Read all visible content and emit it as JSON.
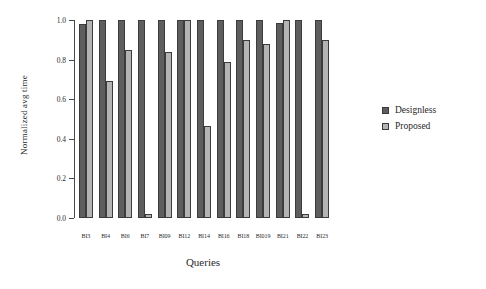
{
  "chart_data": {
    "type": "bar",
    "title": "",
    "xlabel": "Queries",
    "ylabel": "Normalized avg time",
    "ylim": [
      0.0,
      1.0
    ],
    "yticks": [
      "0.0",
      "0.2",
      "0.4",
      "0.6",
      "0.8",
      "1.0"
    ],
    "ytick_values": [
      0.0,
      0.2,
      0.4,
      0.6,
      0.8,
      1.0
    ],
    "grid": false,
    "legend_position": "right",
    "categories": [
      "BI3",
      "BI4",
      "BI6",
      "BI7",
      "BI09",
      "BI12",
      "BI14",
      "BI16",
      "BI18",
      "BI019",
      "BI21",
      "BI22",
      "BI23"
    ],
    "series": [
      {
        "name": "Designless",
        "color": "#5e5e5e",
        "values": [
          0.98,
          1.0,
          1.0,
          1.0,
          1.0,
          1.0,
          1.0,
          1.0,
          1.0,
          1.0,
          0.985,
          1.0,
          1.0
        ]
      },
      {
        "name": "Proposed",
        "color": "#b4b4b4",
        "values": [
          1.0,
          0.69,
          0.85,
          0.02,
          0.84,
          1.0,
          0.465,
          0.79,
          0.9,
          0.88,
          1.0,
          0.02,
          0.9
        ]
      }
    ]
  }
}
